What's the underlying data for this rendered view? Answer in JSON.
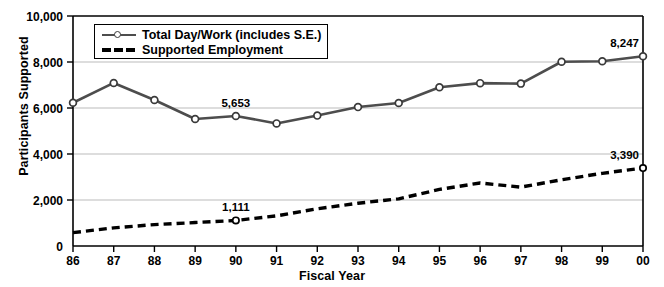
{
  "chart_data": {
    "type": "line",
    "title": "",
    "xlabel": "Fiscal Year",
    "ylabel": "Participants Supported",
    "categories": [
      "86",
      "87",
      "88",
      "89",
      "90",
      "91",
      "92",
      "93",
      "94",
      "95",
      "96",
      "97",
      "98",
      "99",
      "00"
    ],
    "ylim": [
      0,
      10000
    ],
    "ytick_values": [
      0,
      2000,
      4000,
      6000,
      8000,
      10000
    ],
    "ytick_labels": [
      "0",
      "2,000",
      "4,000",
      "6,000",
      "8,000",
      "10,000"
    ],
    "grid": "horizontal",
    "legend_position": "top-left-inside",
    "series": [
      {
        "name": "Total Day/Work (includes S.E.)",
        "style": "solid-with-markers",
        "color": "#4d4d4d",
        "values": [
          6230,
          7090,
          6350,
          5520,
          5653,
          5330,
          5670,
          6040,
          6220,
          6900,
          7080,
          7060,
          8010,
          8030,
          8247
        ]
      },
      {
        "name": "Supported Employment",
        "style": "dashed",
        "color": "#000000",
        "values": [
          580,
          790,
          930,
          1020,
          1111,
          1310,
          1620,
          1860,
          2050,
          2460,
          2740,
          2560,
          2880,
          3160,
          3390
        ]
      }
    ],
    "annotations": [
      {
        "text": "5,653",
        "series": "Total Day/Work (includes S.E.)",
        "category": "90",
        "value": 5653
      },
      {
        "text": "8,247",
        "series": "Total Day/Work (includes S.E.)",
        "category": "00",
        "value": 8247
      },
      {
        "text": "1,111",
        "series": "Supported Employment",
        "category": "90",
        "value": 1111
      },
      {
        "text": "3,390",
        "series": "Supported Employment",
        "category": "00",
        "value": 3390
      }
    ]
  },
  "axes": {
    "y_title": "Participants Supported",
    "x_title": "Fiscal Year"
  },
  "legend": {
    "items": [
      {
        "label": "Total Day/Work (includes S.E.)",
        "marker": "line-with-circle-marker"
      },
      {
        "label": "Supported Employment",
        "marker": "dashed-line"
      }
    ]
  },
  "colors": {
    "solid_series": "#4d4d4d",
    "dashed_series": "#000000",
    "grid": "#b3b3b3",
    "axis": "#000000",
    "background": "#ffffff"
  }
}
